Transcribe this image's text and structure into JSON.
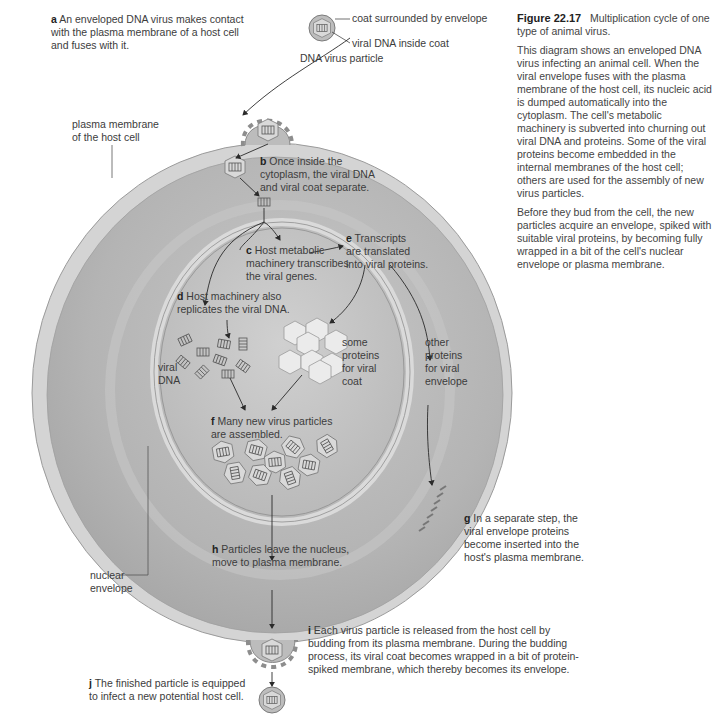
{
  "figure": {
    "number": "Figure 22.17",
    "title": "Multiplication cycle of one type of animal virus.",
    "paragraphs": [
      "This diagram shows an enveloped DNA virus infecting an animal cell. When the viral envelope fuses with the plasma membrane of the host cell, its nucleic acid is dumped automatically into the cytoplasm. The cell's metabolic machinery is subverted into churning out viral DNA and proteins. Some of the viral proteins become embedded in the internal membranes of the host cell; others are used for the assembly of new virus particles.",
      "Before they bud from the cell, the new particles acquire an envelope, spiked with suitable viral proteins, by becoming fully wrapped in a bit of the cell's nuclear envelope or plasma membrane."
    ]
  },
  "particle_legend": {
    "coat": "coat surrounded by envelope",
    "dna": "viral DNA inside coat",
    "caption": "DNA virus particle"
  },
  "structure_labels": {
    "plasma_membrane": [
      "plasma membrane",
      "of the host cell"
    ],
    "nuclear_envelope": [
      "nuclear",
      "envelope"
    ],
    "viral_dna": [
      "viral",
      "DNA"
    ],
    "coat_proteins": [
      "some",
      "proteins",
      "for viral",
      "coat"
    ],
    "envelope_proteins": [
      "other",
      "proteins",
      "for viral",
      "envelope"
    ]
  },
  "steps": [
    {
      "letter": "a",
      "lines": [
        "An enveloped DNA virus makes contact",
        "with the plasma membrane of a host cell",
        "and fuses with it."
      ]
    },
    {
      "letter": "b",
      "lines": [
        "Once inside the",
        "cytoplasm, the viral DNA",
        "and viral coat separate."
      ]
    },
    {
      "letter": "c",
      "lines": [
        "Host metabolic",
        "machinery transcribes",
        "the viral genes."
      ]
    },
    {
      "letter": "d",
      "lines": [
        "Host machinery also",
        "replicates the viral DNA."
      ]
    },
    {
      "letter": "e",
      "lines": [
        "Transcripts",
        "are translated",
        "into viral proteins."
      ]
    },
    {
      "letter": "f",
      "lines": [
        "Many new virus particles",
        "are assembled."
      ]
    },
    {
      "letter": "g",
      "lines": [
        "In a separate step, the",
        "viral envelope proteins",
        "become inserted into the",
        "host's plasma membrane."
      ]
    },
    {
      "letter": "h",
      "lines": [
        "Particles leave the nucleus,",
        "move to plasma membrane."
      ]
    },
    {
      "letter": "i",
      "lines": [
        "Each virus particle is released from the host cell by",
        "budding from its plasma membrane. During the budding",
        "process, its viral coat becomes wrapped in a bit of protein-",
        "spiked membrane, which thereby becomes its envelope."
      ]
    },
    {
      "letter": "j",
      "lines": [
        "The finished particle is equipped",
        "to infect a new potential host cell."
      ]
    }
  ],
  "colors": {
    "background": "#ffffff",
    "cytoplasm": "#b9b9b9",
    "membrane": "#d2d2d2",
    "nucleus": "#c4c4c4",
    "text": "#3c3c3c",
    "arrow": "#2a2a2a"
  }
}
